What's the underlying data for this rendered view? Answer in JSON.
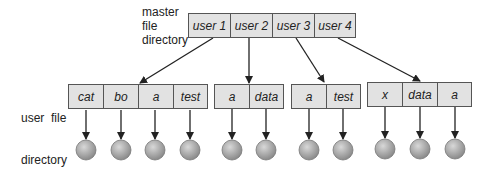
{
  "labels": {
    "master": [
      "master",
      "file",
      "directory"
    ],
    "user": [
      "user  file",
      "directory"
    ]
  },
  "master_directory": [
    "user 1",
    "user 2",
    "user 3",
    "user 4"
  ],
  "user_directories": [
    {
      "owner": "user 1",
      "entries": [
        "cat",
        "bo",
        "a",
        "test"
      ]
    },
    {
      "owner": "user 2",
      "entries": [
        "a",
        "data"
      ]
    },
    {
      "owner": "user 3",
      "entries": [
        "a",
        "test"
      ]
    },
    {
      "owner": "user 4",
      "entries": [
        "x",
        "data",
        "a"
      ]
    }
  ],
  "colors": {
    "cell_fill": "#e2e2e2",
    "border": "#555555",
    "file_node": "#b8b8b8"
  }
}
